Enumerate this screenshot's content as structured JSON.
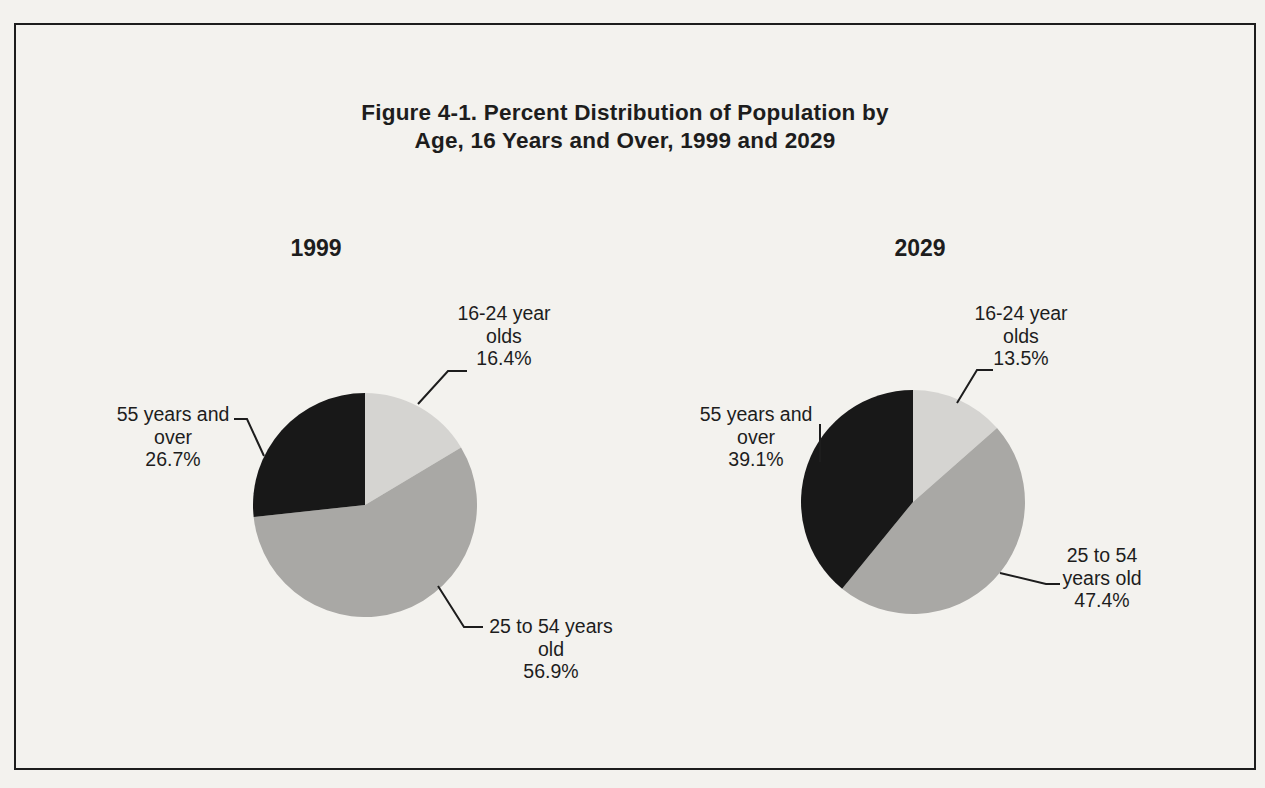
{
  "figure": {
    "title_lines": [
      "Figure 4-1. Percent Distribution of Population by",
      "Age, 16 Years and Over, 1999 and 2029"
    ]
  },
  "colors": {
    "ink": "#1d1d1d",
    "paper": "#f3f2ee",
    "slice_16_24": "#d5d4d1",
    "slice_25_54": "#a9a8a5",
    "slice_55_over": "#181818"
  },
  "chart_data": [
    {
      "type": "pie",
      "title": "1999",
      "categories": [
        "16-24 year olds",
        "25 to 54 years old",
        "55 years and over"
      ],
      "values": [
        16.4,
        56.9,
        26.7
      ],
      "unit": "percent",
      "start_angle": "12-oclock",
      "direction": "clockwise",
      "slice_colors": [
        "#d5d4d1",
        "#a9a8a5",
        "#181818"
      ],
      "labels": [
        {
          "lines": [
            "16-24 year",
            "olds",
            "16.4%"
          ]
        },
        {
          "lines": [
            "25 to 54 years",
            "old",
            "56.9%"
          ]
        },
        {
          "lines": [
            "55 years and",
            "over",
            "26.7%"
          ]
        }
      ]
    },
    {
      "type": "pie",
      "title": "2029",
      "categories": [
        "16-24 year olds",
        "25 to 54 years old",
        "55 years and over"
      ],
      "values": [
        13.5,
        47.4,
        39.1
      ],
      "unit": "percent",
      "start_angle": "12-oclock",
      "direction": "clockwise",
      "slice_colors": [
        "#d5d4d1",
        "#a9a8a5",
        "#181818"
      ],
      "labels": [
        {
          "lines": [
            "16-24 year",
            "olds",
            "13.5%"
          ]
        },
        {
          "lines": [
            "25 to 54",
            "years old",
            "47.4%"
          ]
        },
        {
          "lines": [
            "55 years and",
            "over",
            "39.1%"
          ]
        }
      ]
    }
  ]
}
